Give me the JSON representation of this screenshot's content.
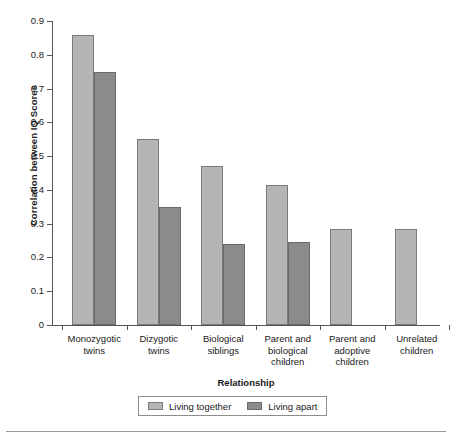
{
  "chart_data": {
    "type": "bar",
    "title": "",
    "xlabel": "Relationship",
    "ylabel": "Correlation between IQ Scores",
    "categories": [
      "Monozygotic\ntwins",
      "Dizygotic\ntwins",
      "Biological\nsiblings",
      "Parent and\nbiological\nchildren",
      "Parent and\nadoptive\nchildren",
      "Unrelated\nchildren"
    ],
    "series": [
      {
        "name": "Living together",
        "color": "#b5b5b5",
        "values": [
          0.86,
          0.55,
          0.47,
          0.415,
          0.285,
          0.285
        ]
      },
      {
        "name": "Living apart",
        "color": "#8b8b8b",
        "values": [
          0.75,
          0.35,
          0.24,
          0.245,
          null,
          null
        ]
      }
    ],
    "ylim": [
      0,
      0.9
    ],
    "yticks": [
      0,
      0.1,
      0.2,
      0.3,
      0.4,
      0.5,
      0.6,
      0.7,
      0.8,
      0.9
    ],
    "ytick_labels": [
      "0",
      "0.1",
      "0.2",
      "0.3",
      "0.4",
      "0.5",
      "0.6",
      "0.7",
      "0.8",
      "0.9"
    ],
    "grid": false,
    "legend_position": "bottom"
  },
  "axis": {
    "y_title": "Correlation between IQ Scores",
    "x_title": "Relationship"
  },
  "legend": {
    "items": [
      {
        "label": "Living together",
        "color": "#b5b5b5"
      },
      {
        "label": "Living apart",
        "color": "#8b8b8b"
      }
    ]
  },
  "colors": {
    "living_together": "#b5b5b5",
    "living_apart": "#8b8b8b",
    "axis": "#555555",
    "text": "#1a1a1a"
  }
}
